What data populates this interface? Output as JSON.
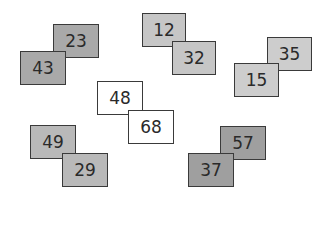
{
  "diagram": {
    "pairs": [
      {
        "name": "top-left",
        "back": {
          "label": "23",
          "x": 53,
          "y": 24,
          "color": "#a9a9a9"
        },
        "front": {
          "label": "43",
          "x": 20,
          "y": 51,
          "color": "#a9a9a9"
        }
      },
      {
        "name": "top-center",
        "back": {
          "label": "12",
          "x": 142,
          "y": 13,
          "color": "#c6c6c6"
        },
        "front": {
          "label": "32",
          "x": 172,
          "y": 41,
          "color": "#c6c6c6"
        }
      },
      {
        "name": "top-right",
        "back": {
          "label": "35",
          "x": 267,
          "y": 37,
          "color": "#cdcdcd"
        },
        "front": {
          "label": "15",
          "x": 234,
          "y": 63,
          "color": "#cdcdcd"
        }
      },
      {
        "name": "center",
        "back": {
          "label": "48",
          "x": 97,
          "y": 81,
          "color": "#ffffff"
        },
        "front": {
          "label": "68",
          "x": 128,
          "y": 110,
          "color": "#ffffff"
        }
      },
      {
        "name": "bottom-left",
        "back": {
          "label": "49",
          "x": 30,
          "y": 125,
          "color": "#b9b9b9"
        },
        "front": {
          "label": "29",
          "x": 62,
          "y": 153,
          "color": "#b9b9b9"
        }
      },
      {
        "name": "bottom-right",
        "back": {
          "label": "57",
          "x": 220,
          "y": 126,
          "color": "#9f9f9f"
        },
        "front": {
          "label": "37",
          "x": 188,
          "y": 153,
          "color": "#9f9f9f"
        }
      }
    ]
  }
}
